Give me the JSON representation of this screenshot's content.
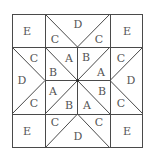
{
  "diagram": {
    "title": "",
    "type": "quilt-block-pattern",
    "line_color": "#4a4a4a",
    "label_color": "#555555",
    "grid": {
      "x": [
        12,
        45,
        77,
        110,
        143
      ],
      "y": [
        14,
        47,
        80,
        114,
        148
      ]
    },
    "labels": [
      {
        "id": "tl-e",
        "text": "E",
        "x": 27,
        "y": 31
      },
      {
        "id": "tr-e",
        "text": "E",
        "x": 127,
        "y": 31
      },
      {
        "id": "bl-e",
        "text": "E",
        "x": 27,
        "y": 131
      },
      {
        "id": "br-e",
        "text": "E",
        "x": 127,
        "y": 131
      },
      {
        "id": "top-d",
        "text": "D",
        "x": 78,
        "y": 24
      },
      {
        "id": "top-c-left",
        "text": "C",
        "x": 55,
        "y": 39
      },
      {
        "id": "top-c-right",
        "text": "C",
        "x": 99,
        "y": 39
      },
      {
        "id": "bottom-d",
        "text": "D",
        "x": 78,
        "y": 136
      },
      {
        "id": "bottom-c-left",
        "text": "C",
        "x": 55,
        "y": 122
      },
      {
        "id": "bottom-c-right",
        "text": "C",
        "x": 99,
        "y": 122
      },
      {
        "id": "left-d",
        "text": "D",
        "x": 22,
        "y": 80
      },
      {
        "id": "left-c-top",
        "text": "C",
        "x": 34,
        "y": 58
      },
      {
        "id": "left-c-bottom",
        "text": "C",
        "x": 34,
        "y": 103
      },
      {
        "id": "right-d",
        "text": "D",
        "x": 131,
        "y": 80
      },
      {
        "id": "right-c-top",
        "text": "C",
        "x": 121,
        "y": 58
      },
      {
        "id": "right-c-bottom",
        "text": "C",
        "x": 121,
        "y": 103
      },
      {
        "id": "center-a-1",
        "text": "A",
        "x": 69,
        "y": 58
      },
      {
        "id": "center-b-1",
        "text": "B",
        "x": 53,
        "y": 72
      },
      {
        "id": "center-b-2",
        "text": "B",
        "x": 86,
        "y": 57
      },
      {
        "id": "center-a-2",
        "text": "A",
        "x": 101,
        "y": 72
      },
      {
        "id": "center-a-3",
        "text": "A",
        "x": 53,
        "y": 91
      },
      {
        "id": "center-b-3",
        "text": "B",
        "x": 69,
        "y": 105
      },
      {
        "id": "center-b-4",
        "text": "B",
        "x": 102,
        "y": 91
      },
      {
        "id": "center-a-4",
        "text": "A",
        "x": 87,
        "y": 105
      }
    ]
  }
}
